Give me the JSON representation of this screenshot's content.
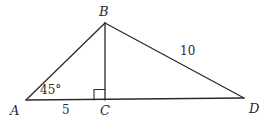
{
  "diagram": {
    "type": "geometry-triangle",
    "stroke_color": "#2a2a2a",
    "vertices": {
      "A": {
        "label": "A",
        "x": 26,
        "y": 100
      },
      "B": {
        "label": "B",
        "x": 105,
        "y": 23
      },
      "C": {
        "label": "C",
        "x": 105,
        "y": 100
      },
      "D": {
        "label": "D",
        "x": 244,
        "y": 98
      }
    },
    "segments": [
      {
        "from": "A",
        "to": "B"
      },
      {
        "from": "B",
        "to": "C"
      },
      {
        "from": "B",
        "to": "D"
      },
      {
        "from": "A",
        "to": "D"
      }
    ],
    "annotations": {
      "angle_A": "45°",
      "length_AC": "5",
      "length_BD": "10",
      "right_angle_at": "C"
    }
  }
}
